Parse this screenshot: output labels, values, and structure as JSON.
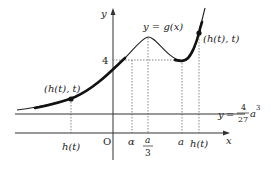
{
  "figure": {
    "axes": {
      "x_label": "x",
      "y_label": "y",
      "origin_label": "O"
    },
    "curve_label": "y = g(x)",
    "curve_label_parts": {
      "lhs": "y",
      "eq": "=",
      "rhs": "g(x)"
    },
    "y_tick_label": "4",
    "horizontal_line_label": {
      "lhs": "y",
      "eq": "=",
      "numerator": "4",
      "denominator": "27",
      "var": "a",
      "exponent": "3"
    },
    "x_ticks": [
      {
        "label": "h(t)",
        "note": "left"
      },
      {
        "label": "α"
      },
      {
        "label_numerator": "a",
        "label_denominator": "3"
      },
      {
        "label": "a"
      },
      {
        "label": "h(t)",
        "note": "right"
      }
    ],
    "points": [
      {
        "label": "(h(t), t)",
        "position": "left"
      },
      {
        "label": "(h(t), t)",
        "position": "right"
      }
    ],
    "colors": {
      "curve": "#222222",
      "highlight": "#111111",
      "axis": "#333333",
      "guide": "#555555"
    }
  }
}
